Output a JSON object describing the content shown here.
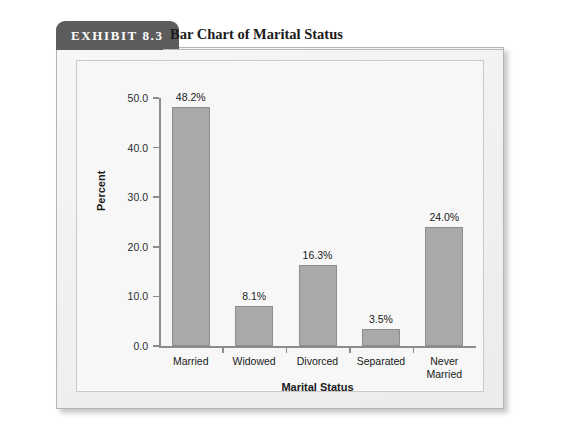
{
  "exhibit": {
    "tab_label": "EXHIBIT 8.3",
    "title": "Bar Chart of Marital Status"
  },
  "chart_data": {
    "type": "bar",
    "title": "Bar Chart of Marital Status",
    "categories": [
      "Married",
      "Widowed",
      "Divorced",
      "Separated",
      "Never Married"
    ],
    "category_lines": [
      [
        "Married"
      ],
      [
        "Widowed"
      ],
      [
        "Divorced"
      ],
      [
        "Separated"
      ],
      [
        "Never",
        "Married"
      ]
    ],
    "values": [
      48.2,
      8.1,
      16.3,
      3.5,
      24.0
    ],
    "data_labels": [
      "48.2%",
      "8.1%",
      "16.3%",
      "3.5%",
      "24.0%"
    ],
    "xlabel": "Marital Status",
    "ylabel": "Percent",
    "ylim": [
      0.0,
      50.0
    ],
    "ytick_labels": [
      "0.0",
      "10.0",
      "20.0",
      "30.0",
      "40.0",
      "50.0"
    ],
    "ytick_values": [
      0.0,
      10.0,
      20.0,
      30.0,
      40.0,
      50.0
    ],
    "grid": false,
    "legend": null,
    "bar_color": "#a9a9a9",
    "bar_edge_color": "#8e8e8e",
    "plot_background": "#f7f7f7",
    "card_background": "#f3f3f3",
    "tab_color": "#5c5c5c"
  }
}
